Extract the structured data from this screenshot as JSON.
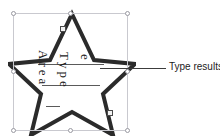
{
  "canvas": {
    "background_color": "#ffffff",
    "width": 220,
    "height": 140
  },
  "shape": {
    "name": "star",
    "kind": "5-point-star",
    "selected": true,
    "outline_color": "#2b2b2b",
    "fill_color": "#ffffff",
    "outline_width": 4
  },
  "selection": {
    "box_color": "#c9c9cf",
    "handle_fill": "#ffffff",
    "handle_border": "#9a9aa2",
    "handles": [
      "top-left",
      "top-center",
      "top-right",
      "middle-left",
      "middle-right",
      "bottom-left",
      "bottom-center",
      "bottom-right"
    ],
    "adjust_handles": [
      "top-adjust",
      "bottom-adjust"
    ],
    "adjust_handle_fill": "#f2f2f2",
    "adjust_handle_border": "#4a4a4a"
  },
  "shape_text": {
    "rotation_degrees": 90,
    "text_color": "#1a1a1a",
    "rule_color": "#5a5a5a",
    "lines": [
      {
        "text": "Area"
      },
      {
        "text": "Type"
      },
      {
        "text": "e"
      }
    ]
  },
  "annotation": {
    "label": "Type results",
    "label_color": "#1c1c1c",
    "leader_line_color": "#3c3c3c"
  }
}
